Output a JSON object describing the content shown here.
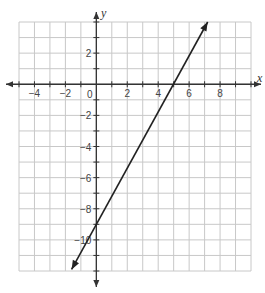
{
  "chart_data": {
    "type": "line",
    "title": "",
    "xlabel": "x",
    "ylabel": "y",
    "xlim": [
      -5,
      10
    ],
    "ylim": [
      -12,
      4
    ],
    "grid": true,
    "x_ticks": [
      -4,
      -2,
      2,
      4,
      6,
      8
    ],
    "y_ticks": [
      2,
      -2,
      -4,
      -6,
      -8,
      -10
    ],
    "origin_label": "0",
    "series": [
      {
        "name": "line",
        "equation": "y = 1.8x - 9",
        "x": [
          -1.6,
          0,
          5,
          7.2
        ],
        "y": [
          -11.9,
          -9,
          0,
          4
        ],
        "x_intercept": 5,
        "y_intercept": -9
      }
    ],
    "line_color": "#222222",
    "grid_color": "#c8c8c8"
  }
}
